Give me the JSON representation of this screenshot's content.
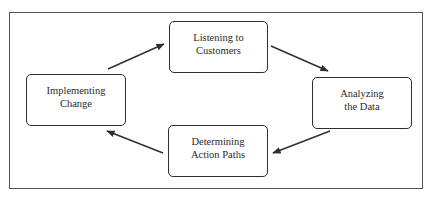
{
  "diagram": {
    "type": "cycle",
    "nodes": [
      {
        "id": "top",
        "lines": [
          "Listening to",
          "Customers"
        ]
      },
      {
        "id": "right",
        "lines": [
          "Analyzing",
          "the Data"
        ]
      },
      {
        "id": "bottom",
        "lines": [
          "Determining",
          "Action Paths"
        ]
      },
      {
        "id": "left",
        "lines": [
          "Implementing",
          "Change"
        ]
      }
    ],
    "edges": [
      {
        "from": "top",
        "to": "right"
      },
      {
        "from": "right",
        "to": "bottom"
      },
      {
        "from": "bottom",
        "to": "left"
      },
      {
        "from": "left",
        "to": "top"
      }
    ],
    "colors": {
      "stroke": "#2f2f2f",
      "frame": "#555555",
      "background": "#ffffff"
    }
  }
}
